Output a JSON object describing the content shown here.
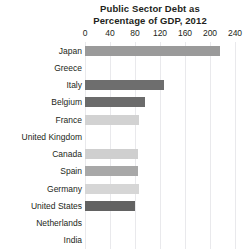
{
  "chart_data": {
    "type": "bar",
    "orientation": "horizontal",
    "title": "Public Sector Debt as Percentage of GDP, 2012",
    "title_lines": [
      "Public Sector Debt as",
      "Percentage of GDP, 2012"
    ],
    "xlabel": "",
    "ylabel": "",
    "xlim": [
      0,
      240
    ],
    "xticks": [
      0,
      40,
      80,
      120,
      160,
      200,
      240
    ],
    "xtick_labels": [
      "0",
      "40",
      "80",
      "120",
      "160",
      "200",
      "240"
    ],
    "grid": "vertical",
    "legend": "none",
    "categories": [
      "Japan",
      "Greece",
      "Italy",
      "Belgium",
      "France",
      "United Kingdom",
      "Canada",
      "Spain",
      "Germany",
      "United States",
      "Netherlands",
      "India"
    ],
    "values": [
      216,
      null,
      126,
      96,
      86,
      null,
      84,
      85,
      86,
      80,
      null,
      null
    ],
    "bars": [
      {
        "label": "Japan",
        "value": 216,
        "color": "#9a9a9a",
        "visible": true
      },
      {
        "label": "Greece",
        "value": null,
        "color": "#ffffff",
        "visible": false
      },
      {
        "label": "Italy",
        "value": 126,
        "color": "#6e6e6e",
        "visible": true
      },
      {
        "label": "Belgium",
        "value": 96,
        "color": "#6b6b6b",
        "visible": true
      },
      {
        "label": "France",
        "value": 86,
        "color": "#d2d2d2",
        "visible": true
      },
      {
        "label": "United Kingdom",
        "value": null,
        "color": "#ffffff",
        "visible": false
      },
      {
        "label": "Canada",
        "value": 84,
        "color": "#cfcfcf",
        "visible": true
      },
      {
        "label": "Spain",
        "value": 85,
        "color": "#a8a8a8",
        "visible": true
      },
      {
        "label": "Germany",
        "value": 86,
        "color": "#d6d6d6",
        "visible": true
      },
      {
        "label": "United States",
        "value": 80,
        "color": "#626262",
        "visible": true
      },
      {
        "label": "Netherlands",
        "value": null,
        "color": "#ffffff",
        "visible": false
      },
      {
        "label": "India",
        "value": null,
        "color": "#ffffff",
        "visible": false
      }
    ],
    "colors": {
      "grid": "#e9e9ec",
      "text": "#231f20",
      "background": "#ffffff"
    }
  }
}
